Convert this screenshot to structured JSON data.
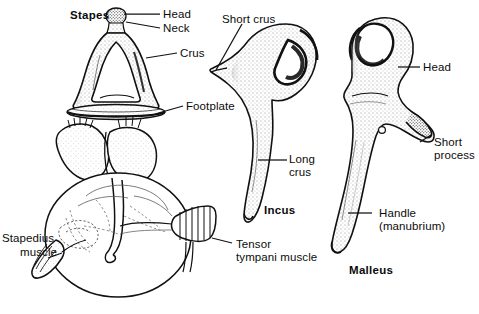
{
  "figure": {
    "background_color": "#ffffff",
    "ink_color": "#111111",
    "style": "stippled pen-and-ink anatomical line drawing"
  },
  "stapes": {
    "name": "Stapes",
    "labels": {
      "head": "Head",
      "neck": "Neck",
      "crus": "Crus",
      "footplate": "Footplate"
    }
  },
  "incus": {
    "name": "Incus",
    "labels": {
      "short_crus": "Short crus",
      "long_crus_line1": "Long",
      "long_crus_line2": "crus"
    }
  },
  "malleus": {
    "name": "Malleus",
    "labels": {
      "head": "Head",
      "short_process_line1": "Short",
      "short_process_line2": "process",
      "handle_line1": "Handle",
      "handle_line2": "(manubrium)"
    }
  },
  "muscles": {
    "stapedius_line1": "Stapedius",
    "stapedius_line2": "muscle",
    "tensor_tympani_line1": "Tensor",
    "tensor_tympani_line2": "tympani muscle"
  }
}
